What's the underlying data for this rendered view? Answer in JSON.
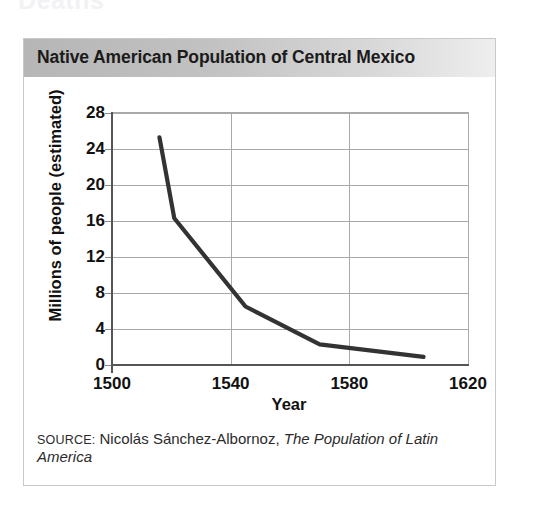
{
  "page": {
    "top_fragment": "Deaths"
  },
  "figure": {
    "title": "Native American Population of Central Mexico",
    "source_label": "SOURCE:",
    "source_author": "Nicolás Sánchez-Albornoz,",
    "source_work": "The Population of Latin America"
  },
  "colors": {
    "title_bar_dark": "#b6b6b6",
    "title_bar_light": "#eeeeee",
    "line": "#333333",
    "grid": "#a9a9a9",
    "axis": "#555555",
    "text": "#111111"
  },
  "chart_data": {
    "type": "line",
    "title": "Native American Population of Central Mexico",
    "xlabel": "Year",
    "ylabel": "Millions of people (estimated)",
    "xlim": [
      1500,
      1620
    ],
    "ylim": [
      0,
      28
    ],
    "xticks": [
      1500,
      1540,
      1580,
      1620
    ],
    "yticks": [
      0,
      4,
      8,
      12,
      16,
      20,
      24,
      28
    ],
    "xtick_labels": [
      "1500",
      "1540",
      "1580",
      "1620"
    ],
    "ytick_labels": [
      "0",
      "4",
      "8",
      "12",
      "16",
      "20",
      "24",
      "28"
    ],
    "grid": true,
    "legend": false,
    "series": [
      {
        "name": "Native American population of Central Mexico",
        "x": [
          1516,
          1521,
          1545,
          1570,
          1605
        ],
        "y": [
          25.3,
          16.3,
          6.5,
          2.3,
          0.9
        ],
        "units": "millions of people (estimated)"
      }
    ]
  }
}
